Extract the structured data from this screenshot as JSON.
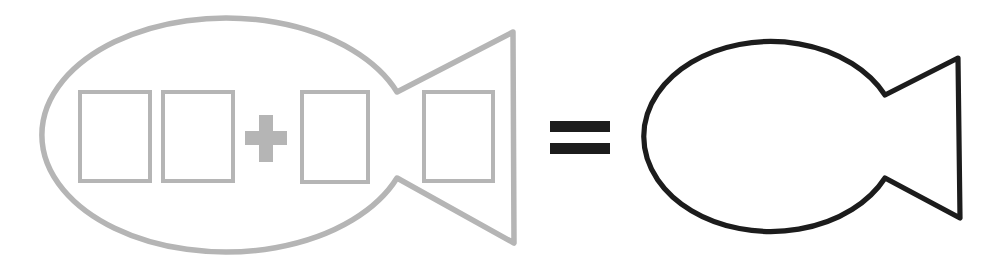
{
  "canvas": {
    "width": 999,
    "height": 263,
    "viewBox": "0 0 999 263",
    "background": "#ffffff"
  },
  "palette": {
    "faded_gray": "#b5b5b5",
    "ink_black": "#1c1c1c"
  },
  "figure": {
    "left_group": "faded-fish-outline-with-four-blank-cards-and-plus-sign",
    "operator_glyph": "=",
    "right_group": "bold-whole-fish-outline"
  },
  "shapes": [
    {
      "name": "gray-fish-outline",
      "tag": "path",
      "attrs": {
        "d": "M 397 92 A 184 117 0 1 0 397 178 L 514 243 L 513 32 Z",
        "fill": "none",
        "stroke": "#b5b5b5",
        "stroke-width": "5.5",
        "stroke-linejoin": "round",
        "stroke-linecap": "round"
      }
    },
    {
      "name": "blank-card-1",
      "tag": "rect",
      "attrs": {
        "x": "80",
        "y": "92",
        "width": "70",
        "height": "89",
        "fill": "none",
        "stroke": "#b5b5b5",
        "stroke-width": "4"
      }
    },
    {
      "name": "blank-card-2",
      "tag": "rect",
      "attrs": {
        "x": "163",
        "y": "92",
        "width": "70",
        "height": "89",
        "fill": "none",
        "stroke": "#b5b5b5",
        "stroke-width": "4"
      }
    },
    {
      "name": "plus-sign",
      "tag": "path",
      "attrs": {
        "d": "M 259 115 H 273 V 131 H 287 V 145 H 273 V 162 H 259 V 145 H 245 V 131 H 259 Z",
        "fill": "#b5b5b5",
        "stroke": "none"
      }
    },
    {
      "name": "blank-card-3",
      "tag": "rect",
      "attrs": {
        "x": "302",
        "y": "92",
        "width": "66",
        "height": "90",
        "fill": "none",
        "stroke": "#b5b5b5",
        "stroke-width": "4"
      }
    },
    {
      "name": "blank-card-4",
      "tag": "rect",
      "attrs": {
        "x": "424",
        "y": "92",
        "width": "69",
        "height": "89",
        "fill": "none",
        "stroke": "#b5b5b5",
        "stroke-width": "4"
      }
    },
    {
      "name": "equals-sign-top-bar",
      "tag": "rect",
      "attrs": {
        "x": "550",
        "y": "121",
        "width": "60",
        "height": "11",
        "fill": "#1c1c1c",
        "stroke": "none"
      }
    },
    {
      "name": "equals-sign-bottom-bar",
      "tag": "rect",
      "attrs": {
        "x": "550",
        "y": "143",
        "width": "60",
        "height": "11",
        "fill": "#1c1c1c",
        "stroke": "none"
      }
    },
    {
      "name": "black-fish-outline",
      "tag": "path",
      "attrs": {
        "d": "M 885 95 A 127 95 0 1 0 885 178 L 960 218 L 958 58 Z",
        "fill": "none",
        "stroke": "#1c1c1c",
        "stroke-width": "5.2",
        "stroke-linejoin": "round",
        "stroke-linecap": "round"
      }
    }
  ]
}
